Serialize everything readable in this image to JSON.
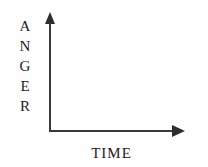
{
  "chart_data": {
    "type": "line",
    "title": "",
    "subtitle": "",
    "xlabel": "TIME",
    "ylabel": "ANGER",
    "ylabel_letters": [
      "A",
      "N",
      "G",
      "E",
      "R"
    ],
    "series": [],
    "categories": [],
    "x": [],
    "values": [],
    "xtick_labels": [],
    "ytick_labels": [],
    "xlim": [],
    "ylim": [],
    "grid": false,
    "legend": false,
    "legend_position": "none",
    "annotations": []
  },
  "axes": {
    "y": {
      "label": "ANGER",
      "label_letters": [
        "A",
        "N",
        "G",
        "E",
        "R"
      ],
      "arrow_direction": "up",
      "line_color": "#3a3a3a",
      "arrow_color": "#2e2e2e"
    },
    "x": {
      "label": "TIME",
      "arrow_direction": "right",
      "line_color": "#3a3a3a",
      "arrow_color": "#2e2e2e"
    }
  },
  "colors": {
    "background": "#fefefe",
    "axis": "#3a3a3a",
    "text": "#1c1c1c"
  }
}
